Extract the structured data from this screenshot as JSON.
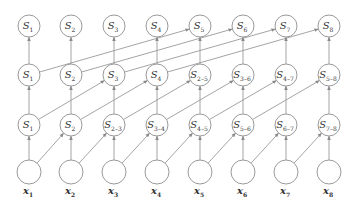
{
  "colors": {
    "stroke": "#9a9a9a",
    "text": "#333333",
    "node_fill": "#ffffff"
  },
  "layout": {
    "columns_x": [
      29,
      71,
      114,
      157,
      200,
      243,
      286,
      329
    ],
    "rows_y": {
      "layer3": 26,
      "layer2": 75,
      "layer1": 125,
      "inputs": 172,
      "input_labels": 194
    },
    "node_radius": 11,
    "input_radius": 12
  },
  "inputs": [
    {
      "base": "x",
      "sub": "1"
    },
    {
      "base": "x",
      "sub": "2"
    },
    {
      "base": "x",
      "sub": "3"
    },
    {
      "base": "x",
      "sub": "4"
    },
    {
      "base": "x",
      "sub": "5"
    },
    {
      "base": "x",
      "sub": "6"
    },
    {
      "base": "x",
      "sub": "7"
    },
    {
      "base": "x",
      "sub": "8"
    }
  ],
  "layers": {
    "layer1": [
      {
        "base": "S",
        "sub": "1"
      },
      {
        "base": "S",
        "sub": "2"
      },
      {
        "base": "S",
        "sub": "2–3"
      },
      {
        "base": "S",
        "sub": "3–4"
      },
      {
        "base": "S",
        "sub": "4–5"
      },
      {
        "base": "S",
        "sub": "5–6"
      },
      {
        "base": "S",
        "sub": "6–7"
      },
      {
        "base": "S",
        "sub": "7–8"
      }
    ],
    "layer2": [
      {
        "base": "S",
        "sub": "1"
      },
      {
        "base": "S",
        "sub": "2"
      },
      {
        "base": "S",
        "sub": "3"
      },
      {
        "base": "S",
        "sub": "4"
      },
      {
        "base": "S",
        "sub": "2–5"
      },
      {
        "base": "S",
        "sub": "3–6"
      },
      {
        "base": "S",
        "sub": "4–7"
      },
      {
        "base": "S",
        "sub": "5–8"
      }
    ],
    "layer3": [
      {
        "base": "S",
        "sub": "1"
      },
      {
        "base": "S",
        "sub": "2"
      },
      {
        "base": "S",
        "sub": "3"
      },
      {
        "base": "S",
        "sub": "4"
      },
      {
        "base": "S",
        "sub": "5"
      },
      {
        "base": "S",
        "sub": "6"
      },
      {
        "base": "S",
        "sub": "7"
      },
      {
        "base": "S",
        "sub": "8"
      }
    ]
  },
  "edges": {
    "inputs_to_layer1_offset": 1,
    "layer1_to_layer2_offset": 2,
    "layer2_to_layer3_offset": 4,
    "vertical": true
  }
}
